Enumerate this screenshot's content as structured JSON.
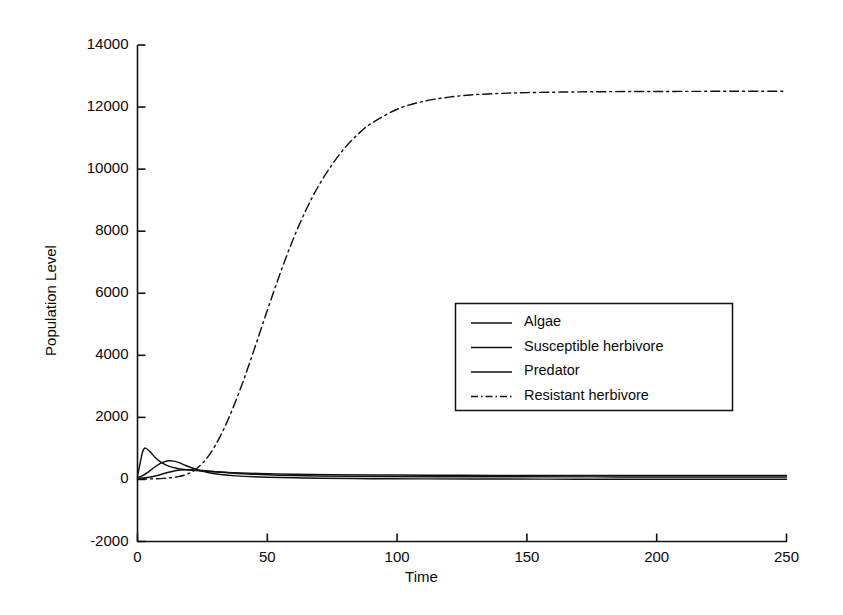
{
  "chart_data": {
    "type": "line",
    "title": "",
    "xlabel": "Time",
    "ylabel": "Population Level",
    "xlim": [
      0,
      250
    ],
    "ylim": [
      -2000,
      14000
    ],
    "xticks": [
      0,
      50,
      100,
      150,
      200,
      250
    ],
    "yticks": [
      -2000,
      0,
      2000,
      4000,
      6000,
      8000,
      10000,
      12000,
      14000
    ],
    "xtick_labels": [
      "0",
      "50",
      "100",
      "150",
      "200",
      "250"
    ],
    "ytick_labels": [
      "-2000",
      "0",
      "2000",
      "4000",
      "6000",
      "8000",
      "10000",
      "12000",
      "14000"
    ],
    "grid": false,
    "legend_position": "center-right",
    "series": [
      {
        "name": "Algae",
        "style": "solid",
        "color": "#111111",
        "x": [
          0,
          1,
          2,
          3,
          5,
          7,
          9,
          12,
          15,
          18,
          22,
          26,
          30,
          35,
          40,
          50,
          60,
          75,
          100,
          125,
          150,
          175,
          200,
          225,
          250
        ],
        "values": [
          120,
          520,
          900,
          1010,
          880,
          690,
          560,
          430,
          360,
          320,
          290,
          265,
          245,
          225,
          210,
          185,
          170,
          155,
          140,
          132,
          128,
          126,
          125,
          124,
          124
        ]
      },
      {
        "name": "Susceptible herbivore",
        "style": "solid",
        "color": "#111111",
        "x": [
          0,
          2,
          4,
          6,
          8,
          10,
          12,
          14,
          16,
          18,
          20,
          24,
          28,
          32,
          38,
          45,
          55,
          70,
          90,
          110,
          140,
          170,
          200,
          225,
          250
        ],
        "values": [
          60,
          120,
          230,
          360,
          480,
          560,
          600,
          590,
          540,
          470,
          400,
          290,
          210,
          160,
          115,
          85,
          60,
          40,
          25,
          18,
          12,
          9,
          8,
          7,
          7
        ]
      },
      {
        "name": "Predator",
        "style": "solid",
        "color": "#111111",
        "x": [
          0,
          3,
          6,
          9,
          12,
          15,
          18,
          22,
          26,
          30,
          36,
          44,
          55,
          70,
          90,
          115,
          145,
          175,
          205,
          230,
          250
        ],
        "values": [
          40,
          55,
          95,
          160,
          230,
          285,
          310,
          305,
          280,
          250,
          210,
          170,
          135,
          110,
          95,
          88,
          84,
          82,
          81,
          80,
          80
        ]
      },
      {
        "name": "Resistant herbivore",
        "style": "dash-dot",
        "color": "#111111",
        "x": [
          0,
          5,
          10,
          15,
          20,
          25,
          30,
          35,
          40,
          45,
          50,
          55,
          60,
          65,
          70,
          75,
          80,
          85,
          90,
          100,
          110,
          120,
          130,
          140,
          150,
          170,
          190,
          210,
          230,
          250
        ],
        "values": [
          10,
          18,
          35,
          80,
          200,
          520,
          1100,
          1950,
          3000,
          4200,
          5450,
          6650,
          7750,
          8700,
          9500,
          10150,
          10700,
          11130,
          11470,
          11930,
          12180,
          12320,
          12400,
          12440,
          12465,
          12490,
          12500,
          12505,
          12508,
          12510
        ]
      }
    ],
    "annotations": {
      "plateau_value": 12500,
      "peak_algae_value": 1010,
      "peak_algae_time": 3
    }
  },
  "legend": {
    "entries": [
      {
        "label": "Algae",
        "style": "solid"
      },
      {
        "label": "Susceptible herbivore",
        "style": "solid"
      },
      {
        "label": "Predator",
        "style": "solid"
      },
      {
        "label": "Resistant herbivore",
        "style": "dash-dot"
      }
    ]
  }
}
